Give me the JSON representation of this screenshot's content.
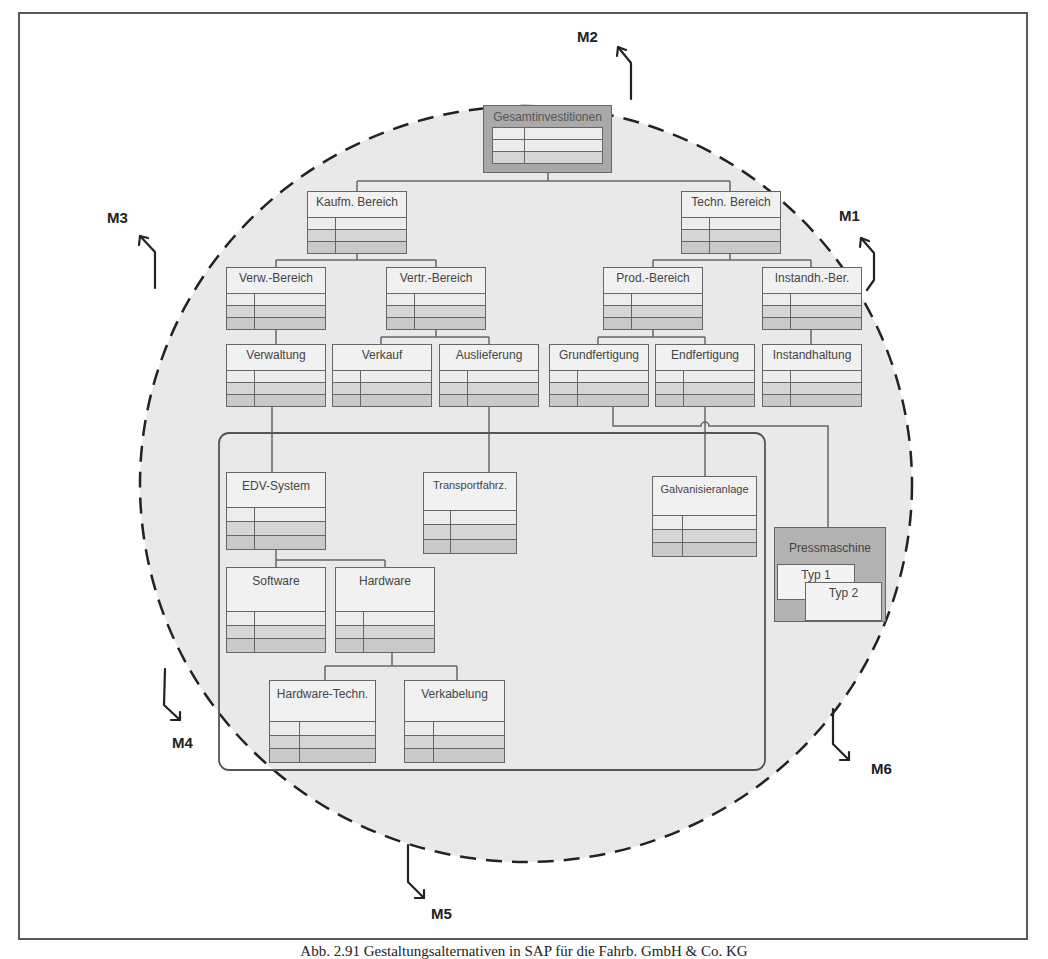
{
  "diagram": {
    "root": "Gesamtinvestitionen",
    "level1": [
      "Kaufm. Bereich",
      "Techn. Bereich"
    ],
    "level2": [
      "Verw.-Bereich",
      "Vertr.-Bereich",
      "Prod.-Bereich",
      "Instandh.-Ber."
    ],
    "level3": [
      "Verwaltung",
      "Verkauf",
      "Auslieferung",
      "Grundfertigung",
      "Endfertigung",
      "Instandhaltung"
    ],
    "assets": [
      "EDV-System",
      "Transportfahrz.",
      "Galvanisieranlage"
    ],
    "edv_children": [
      "Software",
      "Hardware"
    ],
    "hardware_children": [
      "Hardware-Techn.",
      "Verkabelung"
    ],
    "press": {
      "title": "Pressmaschine",
      "types": [
        "Typ 1",
        "Typ 2"
      ]
    },
    "markers": [
      "M1",
      "M2",
      "M3",
      "M4",
      "M5",
      "M6"
    ],
    "edges": [
      [
        "Gesamtinvestitionen",
        "Kaufm. Bereich"
      ],
      [
        "Gesamtinvestitionen",
        "Techn. Bereich"
      ],
      [
        "Kaufm. Bereich",
        "Verw.-Bereich"
      ],
      [
        "Kaufm. Bereich",
        "Vertr.-Bereich"
      ],
      [
        "Techn. Bereich",
        "Prod.-Bereich"
      ],
      [
        "Techn. Bereich",
        "Instandh.-Ber."
      ],
      [
        "Verw.-Bereich",
        "Verwaltung"
      ],
      [
        "Vertr.-Bereich",
        "Verkauf"
      ],
      [
        "Vertr.-Bereich",
        "Auslieferung"
      ],
      [
        "Prod.-Bereich",
        "Grundfertigung"
      ],
      [
        "Prod.-Bereich",
        "Endfertigung"
      ],
      [
        "Instandh.-Ber.",
        "Instandhaltung"
      ],
      [
        "Verwaltung",
        "EDV-System"
      ],
      [
        "Auslieferung",
        "Transportfahrz."
      ],
      [
        "Endfertigung",
        "Galvanisieranlage"
      ],
      [
        "Grundfertigung",
        "Pressmaschine"
      ],
      [
        "EDV-System",
        "Software"
      ],
      [
        "EDV-System",
        "Hardware"
      ],
      [
        "Hardware",
        "Hardware-Techn."
      ],
      [
        "Hardware",
        "Verkabelung"
      ]
    ]
  },
  "caption": "Abb. 2.91 Gestaltungsalternativen in SAP für die Fahrb. GmbH & Co. KG"
}
